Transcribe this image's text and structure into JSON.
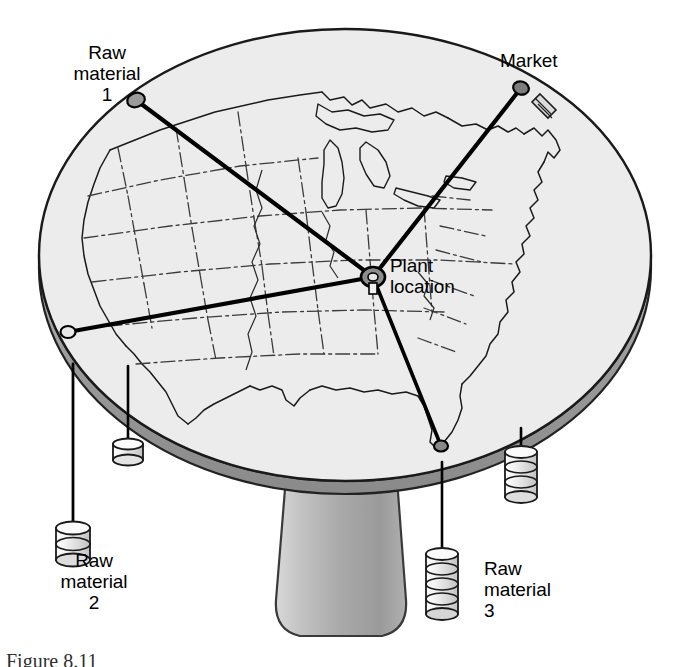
{
  "figure": {
    "caption": "Figure 8.11",
    "background_color": "#ffffff",
    "ink_color": "#000000"
  },
  "table": {
    "name": "round-table-with-map",
    "top_fill": "#ececec",
    "rim_fill": "#9e9e9e",
    "pedestal_fill": "#b5b5b5",
    "outline_color": "#1a1a1a",
    "center_x": 345,
    "center_y": 255,
    "radius_x": 308,
    "radius_y": 228,
    "rim_thickness": 14
  },
  "map": {
    "name": "united-states-map",
    "border_style": "dash-dot",
    "border_color": "#3b3b3b",
    "coast_color": "#1a1a1a"
  },
  "plant": {
    "label": "Plant\nlocation",
    "x": 373,
    "y": 277,
    "marker": "grommet-ring"
  },
  "anchors": [
    {
      "id": "raw-material-1",
      "label": "Raw\nmaterial\n1",
      "anchor_x": 136,
      "anchor_y": 100,
      "edge_x": 128,
      "edge_y": 420,
      "weight_x": 128,
      "weight_y": 448,
      "weight_discs": 1,
      "weight_width": 30,
      "weight_disc_height": 13
    },
    {
      "id": "market",
      "label": "Market",
      "anchor_x": 521,
      "anchor_y": 88,
      "edge_x": 521,
      "edge_y": 440,
      "weight_x": 521,
      "weight_y": 450,
      "weight_discs": 3,
      "weight_width": 32,
      "weight_disc_height": 14
    },
    {
      "id": "raw-material-2",
      "label": "Raw\nmaterial\n2",
      "anchor_x": 68,
      "anchor_y": 332,
      "edge_x": 73,
      "edge_y": 371,
      "weight_x": 73,
      "weight_y": 525,
      "weight_discs": 2,
      "weight_width": 34,
      "weight_disc_height": 14
    },
    {
      "id": "raw-material-3",
      "label": "Raw\nmaterial\n3",
      "anchor_x": 441,
      "anchor_y": 446,
      "edge_x": 442,
      "edge_y": 474,
      "weight_x": 442,
      "weight_y": 552,
      "weight_discs": 4,
      "weight_width": 32,
      "weight_disc_height": 15
    }
  ]
}
